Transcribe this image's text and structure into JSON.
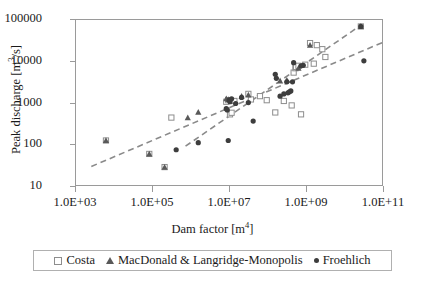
{
  "chart_data": {
    "type": "scatter",
    "title": "",
    "xlabel": "Dam factor [m4]",
    "xlabel_base": "Dam factor [m",
    "xlabel_exp": "4",
    "xlabel_tail": "]",
    "ylabel": "Peak discharge [m3/s]",
    "ylabel_base": "Peak discharge [m",
    "ylabel_exp": "3",
    "ylabel_tail": "/s]",
    "xscale": "log",
    "yscale": "log",
    "xlim": [
      1000,
      100000000000
    ],
    "ylim": [
      10,
      100000
    ],
    "grid": false,
    "legend_position": "below-axes",
    "xticks": [
      "1.0E+03",
      "1.0E+05",
      "1.0E+07",
      "1.0E+09",
      "1.0E+11"
    ],
    "xtick_values": [
      1000,
      100000,
      10000000,
      1000000000,
      100000000000
    ],
    "yticks": [
      "10",
      "100",
      "1000",
      "10000",
      "100000"
    ],
    "ytick_values": [
      10,
      100,
      1000,
      10000,
      100000
    ],
    "series": [
      {
        "name": "Costa",
        "marker": "open-square",
        "color": "#8d8d8d",
        "points": [
          [
            6000,
            130
          ],
          [
            80000,
            62
          ],
          [
            200000,
            30
          ],
          [
            300000,
            460
          ],
          [
            8000000,
            1100
          ],
          [
            9000000,
            1200
          ],
          [
            10000000,
            550
          ],
          [
            11000000,
            600
          ],
          [
            13000000,
            1150
          ],
          [
            30000000,
            1700
          ],
          [
            35000000,
            1250
          ],
          [
            60000000,
            1500
          ],
          [
            90000000,
            1200
          ],
          [
            150000000,
            610
          ],
          [
            250000000,
            1150
          ],
          [
            400000000,
            900
          ],
          [
            700000000,
            550
          ],
          [
            450000000,
            5500
          ],
          [
            500000000,
            7000
          ],
          [
            520000000,
            7500
          ],
          [
            600000000,
            8000
          ],
          [
            900000000,
            8500
          ],
          [
            1200000000,
            28000
          ],
          [
            1800000000,
            25000
          ],
          [
            2500000000,
            20000
          ],
          [
            3000000000,
            13000
          ],
          [
            1500000000,
            9000
          ],
          [
            25000000000,
            70000
          ]
        ]
      },
      {
        "name": "MacDonald & Langridge-Monopolis",
        "marker": "filled-triangle",
        "color": "#595959",
        "points": [
          [
            6000,
            130
          ],
          [
            80000,
            62
          ],
          [
            200000,
            30
          ],
          [
            800000,
            460
          ],
          [
            1500000,
            620
          ],
          [
            8000000,
            1300
          ],
          [
            9000000,
            1250
          ],
          [
            20000000,
            1500
          ],
          [
            30000000,
            1600
          ],
          [
            200000000,
            3500
          ],
          [
            300000000,
            3600
          ],
          [
            600000000,
            7000
          ],
          [
            1200000000,
            25000
          ],
          [
            25000000000,
            70000
          ]
        ]
      },
      {
        "name": "Froehlich",
        "marker": "filled-circle",
        "color": "#3d3d3d",
        "points": [
          [
            400000,
            78
          ],
          [
            1500000,
            115
          ],
          [
            9000000,
            130
          ],
          [
            8000000,
            750
          ],
          [
            8500000,
            700
          ],
          [
            9500000,
            1200
          ],
          [
            10000000,
            1100
          ],
          [
            11000000,
            1300
          ],
          [
            14000000,
            1000
          ],
          [
            20000000,
            1400
          ],
          [
            30000000,
            1050
          ],
          [
            40000000,
            380
          ],
          [
            150000000,
            5000
          ],
          [
            160000000,
            4000
          ],
          [
            200000000,
            1500
          ],
          [
            300000000,
            3300
          ],
          [
            320000000,
            1800
          ],
          [
            350000000,
            1900
          ],
          [
            380000000,
            2000
          ],
          [
            420000000,
            3300
          ],
          [
            450000000,
            9500
          ],
          [
            700000000,
            8000
          ],
          [
            800000000,
            8200
          ],
          [
            250000000,
            1700
          ],
          [
            25000000000,
            70000
          ],
          [
            30000000000,
            10500
          ]
        ]
      }
    ],
    "trendlines": [
      {
        "name": "upper-fit",
        "style": "dashed",
        "color": "#8a8a8a",
        "start": [
          2500,
          31
        ],
        "end": [
          100000000000,
          30000
        ]
      },
      {
        "name": "steep-fit",
        "style": "dashed",
        "color": "#8a8a8a",
        "start": [
          700000,
          95
        ],
        "end": [
          25000000000,
          75000
        ]
      }
    ],
    "legend": [
      {
        "label": "Costa",
        "marker": "open-square"
      },
      {
        "label": "MacDonald & Langridge-Monopolis",
        "marker": "filled-triangle"
      },
      {
        "label": "Froehlich",
        "marker": "filled-circle"
      }
    ]
  }
}
